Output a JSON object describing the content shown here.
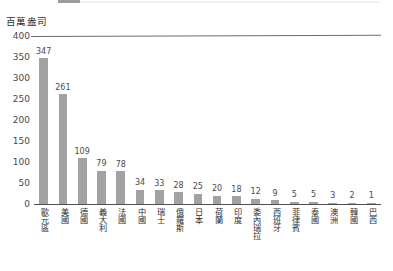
{
  "chart_data": {
    "type": "bar",
    "title": "百萬盎司",
    "subtitle": "",
    "xlabel": "",
    "ylabel": "百萬盎司",
    "ylim": [
      0,
      400
    ],
    "yticks": [
      400,
      350,
      300,
      250,
      200,
      150,
      100,
      50,
      0
    ],
    "grid": false,
    "legend": null,
    "orientation": "vertical",
    "bar_color": "#a2a2a2",
    "axis_color": "#4f4f4f",
    "categories": [
      "歐元區",
      "美國",
      "德國",
      "義大利",
      "法國",
      "中國",
      "瑞士",
      "俄羅斯",
      "日本",
      "荷蘭",
      "印度",
      "委內瑞拉",
      "西班牙",
      "菲律賓",
      "泰國",
      "澳洲",
      "韓國",
      "巴西"
    ],
    "values": [
      347,
      261,
      109,
      79,
      78,
      34,
      33,
      28,
      25,
      20,
      18,
      12,
      9,
      5,
      5,
      3,
      2,
      1
    ],
    "value_labels": [
      "347",
      "261",
      "109",
      "79",
      "78",
      "34",
      "33",
      "28",
      "25",
      "20",
      "18",
      "12",
      "9",
      "5",
      "5",
      "3",
      "2",
      "1"
    ]
  }
}
